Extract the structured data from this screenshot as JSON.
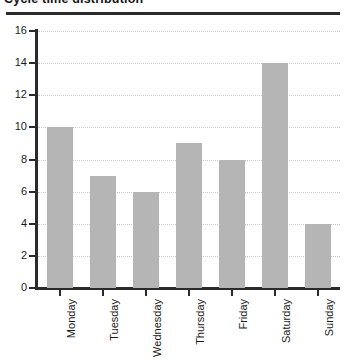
{
  "chart_data": {
    "type": "bar",
    "title": "Cycle time distribution",
    "xlabel": "",
    "ylabel": "",
    "categories": [
      "Monday",
      "Tuesday",
      "Wednesday",
      "Thursday",
      "Friday",
      "Saturday",
      "Sunday"
    ],
    "values": [
      10,
      7,
      6,
      9,
      8,
      14,
      4
    ],
    "yticks": [
      0,
      2,
      4,
      6,
      8,
      10,
      12,
      14,
      16
    ],
    "ylim": [
      0,
      16
    ],
    "ytick_labels": [
      "0",
      "2",
      "4",
      "6",
      "8",
      "10",
      "12",
      "14",
      "16"
    ],
    "grid": true,
    "grid_axis": "y",
    "grid_style": "dotted",
    "legend": false,
    "legend_position": "none",
    "bar_color": "#b5b5b5",
    "axis_color": "#2b2b2b",
    "grid_color": "#c9c9c9",
    "xtick_label_rotation": 90
  }
}
